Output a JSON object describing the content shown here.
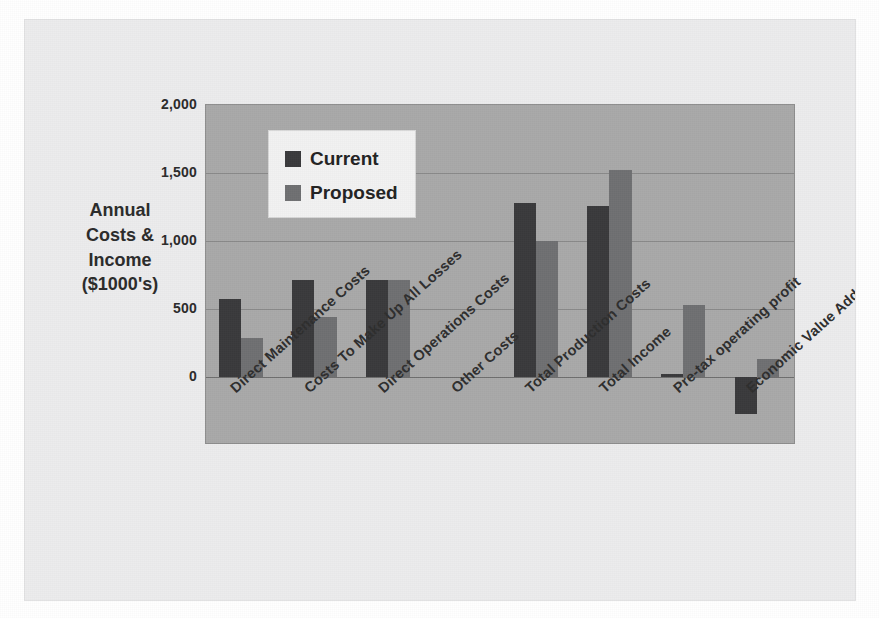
{
  "chart_data": {
    "type": "bar",
    "title": "",
    "ylabel_lines": [
      "Annual",
      "Costs &",
      "Income",
      "($1000's)"
    ],
    "ylabel": "Annual Costs & Income ($1000's)",
    "xlabel": "",
    "ylim": [
      -500,
      2000
    ],
    "yticks": [
      2000,
      1500,
      1000,
      500,
      0
    ],
    "ytick_labels": [
      "2,000",
      "1,500",
      "1,000",
      "500",
      "0"
    ],
    "grid": true,
    "legend_position": "upper-left-inside",
    "categories": [
      "Direct Maintenance Costs",
      "Costs To Make Up All Losses",
      "Direct Operations Costs",
      "Other Costs",
      "Total Production Costs",
      "Total Income",
      "Pre-tax operating profit",
      "Economic Value Added"
    ],
    "series": [
      {
        "name": "Current",
        "color": "#3a3a3c",
        "values": [
          575,
          715,
          710,
          0,
          1280,
          1260,
          20,
          -270
        ]
      },
      {
        "name": "Proposed",
        "color": "#6f7072",
        "values": [
          290,
          440,
          710,
          0,
          1000,
          1520,
          530,
          130
        ]
      }
    ]
  },
  "legend": {
    "items": [
      {
        "label": "Current"
      },
      {
        "label": "Proposed"
      }
    ]
  },
  "colors": {
    "plot_background": "#a9a9a9",
    "sheet_background": "#ececed",
    "gridline": "#8a8a8a",
    "current_series": "#3a3a3c",
    "proposed_series": "#6f7072",
    "text": "#2b2b2b"
  }
}
